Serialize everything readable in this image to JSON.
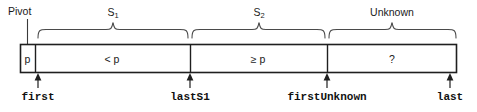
{
  "figure": {
    "title_alt": "Quicksort partition invariant diagram",
    "width": 477,
    "height": 112,
    "stroke_color": "#2b2b2b",
    "text_color": "#1a1a1a",
    "background": "#ffffff"
  },
  "top_annotations": {
    "pivot": {
      "label": "Pivot",
      "x": 24,
      "y": 6
    }
  },
  "braces": [
    {
      "name": "s1",
      "label_main": "S",
      "label_sub": "1",
      "label_x": 113,
      "label_y": 7,
      "start_x": 38,
      "end_x": 188,
      "mid_x": 113
    },
    {
      "name": "s2",
      "label_main": "S",
      "label_sub": "2",
      "label_x": 259,
      "label_y": 7,
      "start_x": 192,
      "end_x": 325,
      "mid_x": 259
    },
    {
      "name": "unknown",
      "label_main": "Unknown",
      "label_sub": "",
      "label_x": 392,
      "label_y": 7,
      "start_x": 329,
      "end_x": 456,
      "mid_x": 392
    }
  ],
  "array_box": {
    "left": 20,
    "right": 457,
    "top": 44,
    "bottom": 72,
    "dividers": [
      35,
      190,
      327
    ]
  },
  "cells": [
    {
      "name": "pivot-cell",
      "text": "p",
      "center_x": 27.5,
      "center_y": 59
    },
    {
      "name": "less-than-pivot-cell",
      "text": "< p",
      "center_x": 112,
      "center_y": 59
    },
    {
      "name": "greater-equal-pivot-cell",
      "text": "≥ p",
      "center_x": 258,
      "center_y": 59
    },
    {
      "name": "unknown-cell",
      "text": "?",
      "center_x": 392,
      "center_y": 59
    }
  ],
  "index_markers": [
    {
      "name": "first",
      "label": "first",
      "x": 38,
      "label_y": 92,
      "arrow_top": 73,
      "arrow_bottom": 88
    },
    {
      "name": "lastS1",
      "label": "lastS1",
      "x": 190,
      "label_y": 92,
      "arrow_top": 73,
      "arrow_bottom": 88
    },
    {
      "name": "firstUnknown",
      "label": "firstUnknown",
      "x": 327,
      "label_y": 92,
      "arrow_top": 73,
      "arrow_bottom": 88
    },
    {
      "name": "last",
      "label": "last",
      "x": 450,
      "label_y": 92,
      "arrow_top": 73,
      "arrow_bottom": 88
    }
  ]
}
